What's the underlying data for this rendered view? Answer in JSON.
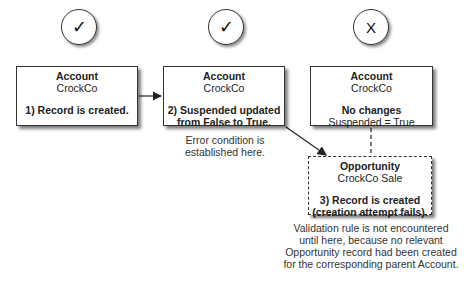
{
  "status_icons": [
    {
      "symbol": "✓",
      "meaning": "success"
    },
    {
      "symbol": "✓",
      "meaning": "success"
    },
    {
      "symbol": "X",
      "meaning": "failure"
    }
  ],
  "boxes": [
    {
      "object": "Account",
      "name": "CrockCo",
      "step_lines": [
        "1) Record is created."
      ]
    },
    {
      "object": "Account",
      "name": "CrockCo",
      "step_lines": [
        "2) Suspended updated",
        "from False to True."
      ]
    },
    {
      "object": "Account",
      "name": "CrockCo",
      "bold_line": "No changes",
      "normal_line": "Suspended = True"
    },
    {
      "object": "Opportunity",
      "name": "CrockCo Sale",
      "step_lines": [
        "3) Record is created",
        "(creation attempt fails)."
      ]
    }
  ],
  "notes": {
    "error": [
      "Error condition is",
      "established here."
    ],
    "validation": [
      "Validation rule is not encountered",
      "until here, because no relevant",
      "Opportunity record had been created",
      "for the corresponding parent Account."
    ]
  }
}
